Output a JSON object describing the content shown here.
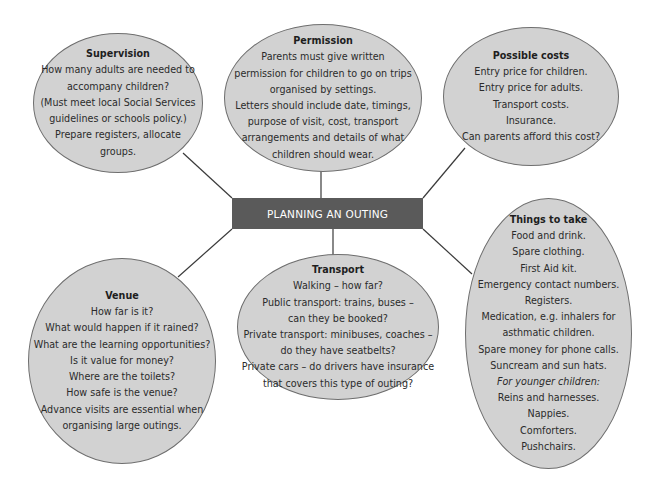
{
  "diagram": {
    "center": {
      "label": "PLANNING AN OUTING"
    },
    "nodes": {
      "supervision": {
        "title": "Supervision",
        "lines": [
          "How many adults are needed to",
          "accompany children?",
          "(Must meet local Social Services",
          "guidelines or schools policy.)",
          "Prepare registers, allocate",
          "groups."
        ]
      },
      "permission": {
        "title": "Permission",
        "lines": [
          "Parents must give written",
          "permission for children to go on trips",
          "organised by settings.",
          "Letters should include date, timings,",
          "purpose of visit, cost, transport",
          "arrangements and details of what",
          "children should wear."
        ]
      },
      "possible_costs": {
        "title": "Possible costs",
        "lines": [
          "Entry price for children.",
          "Entry price for adults.",
          "Transport costs.",
          "Insurance.",
          "Can parents afford this cost?"
        ]
      },
      "venue": {
        "title": "Venue",
        "lines": [
          "How far is it?",
          "What would happen if it rained?",
          "What are the learning opportunities?",
          "Is it value for money?",
          "Where are the toilets?",
          "How safe is the venue?",
          "Advance visits are essential when",
          "organising large outings."
        ]
      },
      "transport": {
        "title": "Transport",
        "lines": [
          "Walking – how far?",
          "Public transport: trains, buses –",
          "can they be booked?",
          "Private transport: minibuses, coaches –",
          "do they have seatbelts?",
          "Private cars – do drivers have insurance",
          "that covers this type of outing?"
        ]
      },
      "things_to_take": {
        "title": "Things to take",
        "lines": [
          "Food and drink.",
          "Spare clothing.",
          "First Aid kit.",
          "Emergency contact numbers.",
          "Registers.",
          "Medication, e.g. inhalers for",
          "asthmatic children.",
          "Spare money for phone calls.",
          "Suncream and sun hats.",
          "For younger children:",
          "Reins and harnesses.",
          "Nappies.",
          "Comforters.",
          "Pushchairs."
        ]
      }
    },
    "colors": {
      "bubble_fill": "#d2d2d2",
      "bubble_border": "#6e6e6e",
      "center_fill": "#5a5a5a",
      "center_text": "#ffffff",
      "connector": "#3a3a3a"
    }
  }
}
